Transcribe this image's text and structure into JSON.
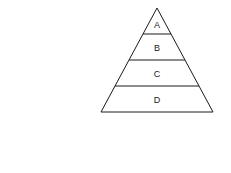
{
  "diagram": {
    "type": "pyramid",
    "stroke_color": "#1a1a1a",
    "background": "#ffffff",
    "levels": [
      {
        "label": "A"
      },
      {
        "label": "B"
      },
      {
        "label": "C"
      },
      {
        "label": "D"
      }
    ]
  }
}
